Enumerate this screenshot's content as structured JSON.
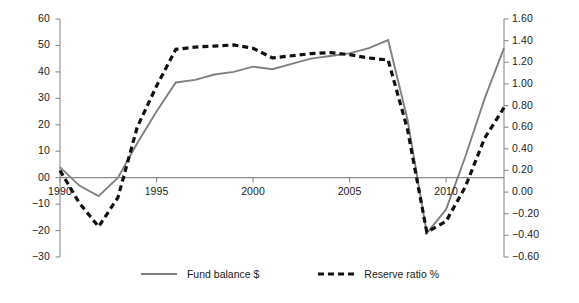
{
  "chart_data": {
    "type": "line",
    "title": "",
    "xlabel": "",
    "ylabel": "",
    "y2label": "",
    "grid": false,
    "legend_position": "bottom",
    "x": [
      1990,
      1991,
      1992,
      1993,
      1994,
      1995,
      1996,
      1997,
      1998,
      1999,
      2000,
      2001,
      2002,
      2003,
      2004,
      2005,
      2006,
      2007,
      2008,
      2009,
      2010,
      2011,
      2012,
      2013
    ],
    "xlim": [
      1990,
      2013
    ],
    "xticks": [
      1990,
      1995,
      2000,
      2005,
      2010
    ],
    "xticklabels": [
      "1990",
      "1995",
      "2000",
      "2005",
      "2010"
    ],
    "ylim": [
      -30,
      60
    ],
    "yticks": [
      -30,
      -20,
      -10,
      0,
      10,
      20,
      30,
      40,
      50,
      60
    ],
    "yticklabels": [
      "−30",
      "−20",
      "−10",
      "00",
      "10",
      "20",
      "30",
      "40",
      "50",
      "60"
    ],
    "y2lim": [
      -0.6,
      1.6
    ],
    "y2ticks": [
      -0.6,
      -0.4,
      -0.2,
      0.0,
      0.2,
      0.4,
      0.6,
      0.8,
      1.0,
      1.2,
      1.4,
      1.6
    ],
    "y2ticklabels": [
      "−0.60",
      "−0.40",
      "−0.20",
      "0.00",
      "0.20",
      "0.40",
      "0.60",
      "0.80",
      "1.00",
      "1.20",
      "1.40",
      "1.60"
    ],
    "zero_line": 0,
    "series": [
      {
        "name": "Fund balance $",
        "axis": "left",
        "style": "solid",
        "color": "#808080",
        "values": [
          4,
          -3,
          -7,
          0,
          13,
          25,
          36,
          37,
          39,
          40,
          42,
          41,
          43,
          45,
          46,
          47,
          49,
          52,
          22,
          -21,
          -12,
          8,
          30,
          49
        ]
      },
      {
        "name": "Reserve ratio %",
        "axis": "right",
        "style": "dashed",
        "color": "#111111",
        "values": [
          0.2,
          -0.1,
          -0.32,
          -0.05,
          0.6,
          0.98,
          1.32,
          1.34,
          1.35,
          1.36,
          1.33,
          1.24,
          1.26,
          1.28,
          1.29,
          1.27,
          1.24,
          1.22,
          0.58,
          -0.37,
          -0.27,
          0.05,
          0.5,
          0.78
        ]
      }
    ]
  },
  "legend": {
    "items": [
      {
        "label": "Fund balance $",
        "style": "solid",
        "color": "#808080"
      },
      {
        "label": "Reserve ratio %",
        "style": "dashed",
        "color": "#111111"
      }
    ]
  }
}
